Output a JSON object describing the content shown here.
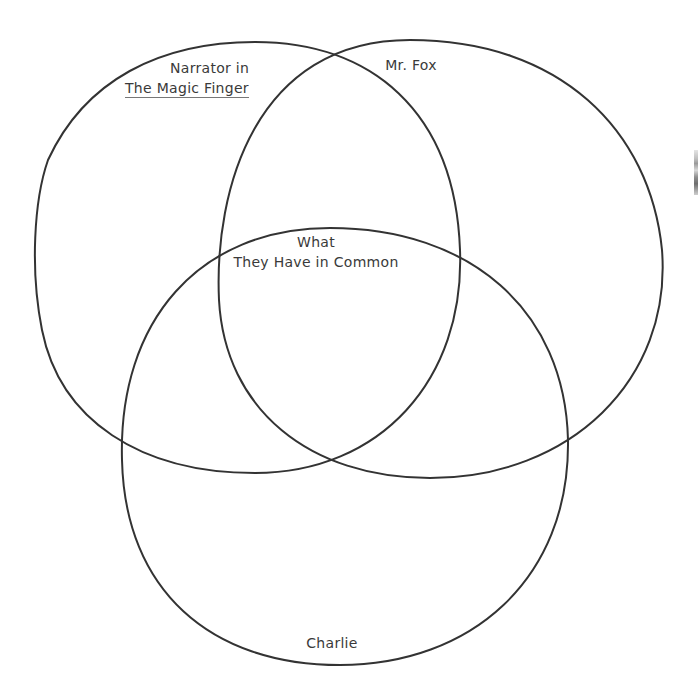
{
  "diagram": {
    "type": "three-set-venn",
    "stroke_color": "#333333",
    "background_color": "#ffffff",
    "sets": [
      {
        "id": "narrator",
        "label_line1": "Narrator in",
        "label_line2": "The Magic Finger",
        "position": "top-left"
      },
      {
        "id": "mr-fox",
        "label_line1": "Mr. Fox",
        "position": "top-right"
      },
      {
        "id": "charlie",
        "label_line1": "Charlie",
        "position": "bottom"
      }
    ],
    "center": {
      "label_line1": "What",
      "label_line2": "They Have in Common"
    }
  }
}
